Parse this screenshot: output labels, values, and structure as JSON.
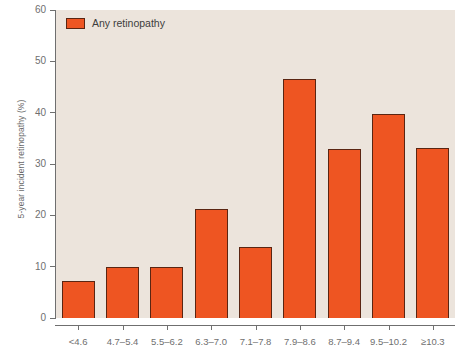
{
  "chart_data": {
    "type": "bar",
    "title": "",
    "xlabel": "",
    "ylabel": "5-year incident retinopathy (%)",
    "categories": [
      "<4.6",
      "4.7–5.4",
      "5.5–6.2",
      "6.3–7.0",
      "7.1–7.8",
      "7.9–8.6",
      "8.7–9.4",
      "9.5–10.2",
      "≥10.3"
    ],
    "series": [
      {
        "name": "Any retinopathy",
        "values": [
          7.2,
          10.0,
          10.0,
          21.3,
          13.9,
          46.5,
          33.0,
          39.8,
          33.2
        ],
        "color": "#ee5522"
      }
    ],
    "ylim": [
      0,
      60
    ],
    "yticks": [
      0,
      10,
      20,
      30,
      40,
      50,
      60
    ],
    "ytick_labels": [
      "0",
      "10",
      "20",
      "30",
      "40",
      "50",
      "60"
    ],
    "grid": false,
    "legend": {
      "position": "top-left",
      "entries": [
        {
          "label": "Any retinopathy",
          "color": "#ee5522"
        }
      ]
    },
    "plot_background": "#ece4dc",
    "axis_color": "#6f6f6f",
    "bar_border_color": "#5a2512"
  }
}
